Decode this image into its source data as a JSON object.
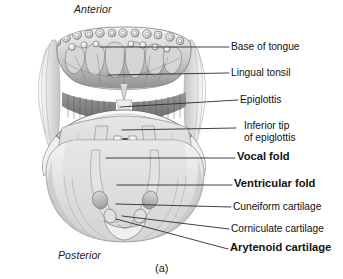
{
  "figure": {
    "caption": "(a)",
    "orientation": {
      "top_label": "Anterior",
      "bottom_label": "Posterior"
    },
    "colors": {
      "background": "#ffffff",
      "ink": "#111111",
      "leader_line": "#333333",
      "tissue_light": "#e8e8e8",
      "tissue_mid": "#b9b9b9",
      "tissue_dark": "#7d7d7d"
    }
  },
  "callouts": [
    {
      "id": "base-of-tongue",
      "label": "Base of tongue",
      "bold": false,
      "lines": [
        "Base of tongue"
      ]
    },
    {
      "id": "lingual-tonsil",
      "label": "Lingual tonsil",
      "bold": false,
      "lines": [
        "Lingual tonsil"
      ]
    },
    {
      "id": "epiglottis",
      "label": "Epiglottis",
      "bold": false,
      "lines": [
        "Epiglottis"
      ]
    },
    {
      "id": "inferior-tip-of-epiglottis",
      "label": "Inferior tip of epiglottis",
      "bold": false,
      "lines": [
        "Inferior tip",
        "of epiglottis"
      ]
    },
    {
      "id": "vocal-fold",
      "label": "Vocal fold",
      "bold": true,
      "lines": [
        "Vocal fold"
      ]
    },
    {
      "id": "ventricular-fold",
      "label": "Ventricular fold",
      "bold": true,
      "lines": [
        "Ventricular fold"
      ]
    },
    {
      "id": "cuneiform-cartilage",
      "label": "Cuneiform cartilage",
      "bold": false,
      "lines": [
        "Cuneiform cartilage"
      ]
    },
    {
      "id": "corniculate-cartilage",
      "label": "Corniculate cartilage",
      "bold": false,
      "lines": [
        "Corniculate cartilage"
      ]
    },
    {
      "id": "arytenoid-cartilage",
      "label": "Arytenoid cartilage",
      "bold": true,
      "lines": [
        "Arytenoid cartilage"
      ]
    }
  ],
  "label_text": {
    "base_of_tongue": "Base of tongue",
    "lingual_tonsil": "Lingual tonsil",
    "epiglottis": "Epiglottis",
    "inferior_tip_line1": "Inferior tip",
    "inferior_tip_line2": "of epiglottis",
    "vocal_fold": "Vocal fold",
    "ventricular_fold": "Ventricular fold",
    "cuneiform_cartilage": "Cuneiform cartilage",
    "corniculate_cartilage": "Corniculate cartilage",
    "arytenoid_cartilage": "Arytenoid cartilage"
  }
}
